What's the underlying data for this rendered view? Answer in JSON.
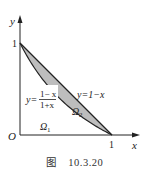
{
  "figure": {
    "caption_prefix": "图",
    "caption_number": "10.3.20",
    "axes": {
      "x_label": "x",
      "y_label": "y",
      "origin_label": "O",
      "x_tick_label": "1",
      "y_tick_label": "1"
    },
    "curves": [
      {
        "name": "line",
        "equation_label": "y=1−x"
      },
      {
        "name": "hyperbola",
        "equation_label_lhs": "y=",
        "numerator": "1− x",
        "denominator": "1+x"
      }
    ],
    "regions": [
      {
        "name": "Omega1",
        "label": "Ω",
        "subscript": "1",
        "shaded": false
      },
      {
        "name": "Omega2",
        "label": "Ω",
        "subscript": "2",
        "shaded": true
      }
    ],
    "colors": {
      "shade": "#bdbdbd",
      "stroke": "#222222"
    }
  }
}
